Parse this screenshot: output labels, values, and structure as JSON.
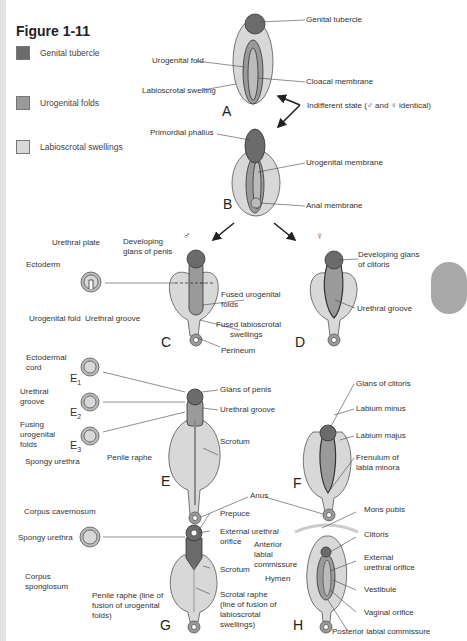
{
  "figure": {
    "title": "Figure 1-11",
    "colors": {
      "genital_tubercle": "#6b6b6b",
      "urogenital_folds": "#9a9a9a",
      "labioscrotal_swellings": "#d8d8d8",
      "strip": "#e3e3e3",
      "tab": "#a8a8a8"
    }
  },
  "legend": [
    {
      "label": "Genital tubercle",
      "color": "#6b6b6b"
    },
    {
      "label": "Urogenital folds",
      "color": "#9a9a9a"
    },
    {
      "label": "Labioscrotal swellings",
      "color": "#d8d8d8"
    }
  ],
  "panels": {
    "A": {
      "letter": "A",
      "labels": {
        "urogenital_fold": "Urogenital fold",
        "labioscrotal_swelling": "Labioscrotal swelling",
        "genital_tubercle": "Genital tubercle",
        "cloacal_membrane": "Cloacal membrane"
      }
    },
    "indifferent": "Indifferent state (♂ and ♀ identical)",
    "B": {
      "letter": "B",
      "labels": {
        "primordial_phallus": "Primordial phallus",
        "urogenital_membrane": "Urogenital membrane",
        "anal_membrane": "Anal membrane"
      }
    },
    "male_symbol": "♂",
    "female_symbol": "♀",
    "C": {
      "letter": "C",
      "labels": {
        "urethral_plate": "Urethral plate",
        "ectoderm": "Ectoderm",
        "urogenital_fold": "Urogenital fold",
        "urethral_groove": "Urethral groove",
        "developing_glans_1": "Developing",
        "developing_glans_2": "glans of penis",
        "fused_folds_1": "Fused urogenital",
        "fused_folds_2": "folds",
        "fused_swell_1": "Fused labioscrotal",
        "fused_swell_2": "swellings",
        "perineum": "Perineum"
      }
    },
    "D": {
      "letter": "D",
      "labels": {
        "glans_1": "Developing glans",
        "glans_2": "of clitoris",
        "urethral_groove": "Urethral groove"
      }
    },
    "E": {
      "letter": "E",
      "labels": {
        "ectodermal_1": "Ectodermal",
        "ectodermal_2": "cord",
        "e1": "E",
        "e1_sub": "1",
        "urethral_groove_1": "Urethral",
        "urethral_groove_2": "groove",
        "e2": "E",
        "e2_sub": "2",
        "fusing_1": "Fusing",
        "fusing_2": "urogenital",
        "fusing_3": "folds",
        "e3": "E",
        "e3_sub": "3",
        "spongy_urethra": "Spongy urethra",
        "penile_raphe": "Penile raphe",
        "glans_of_penis": "Glans of penis",
        "urethral_groove": "Urethral groove",
        "scrotum": "Scrotum",
        "anus": "Anus"
      }
    },
    "F": {
      "letter": "F",
      "labels": {
        "glans_of_clitoris": "Glans of clitoris",
        "labium_minus": "Labium minus",
        "labium_majus": "Labium majus",
        "frenulum_1": "Frenulum of",
        "frenulum_2": "labia minora"
      }
    },
    "G": {
      "letter": "G",
      "labels": {
        "corpus_cavernosum": "Corpus cavernosum",
        "spongy_urethra": "Spongy urethra",
        "corpus_sp_1": "Corpus",
        "corpus_sp_2": "spongiosum",
        "raphe_1": "Penile raphe (line of",
        "raphe_2": "fusion of urogenital",
        "raphe_3": "folds)",
        "prepuce": "Prepuce",
        "ext_1": "External urethral",
        "ext_2": "orifice",
        "scrotum": "Scrotum",
        "scrotal_1": "Scrotal raphe",
        "scrotal_2": "(line of fusion of",
        "scrotal_3": "labioscrotal",
        "scrotal_4": "swellings)"
      }
    },
    "H": {
      "letter": "H",
      "labels": {
        "mons_pubis": "Mons pubis",
        "clitoris": "Clitoris",
        "anterior_1": "Anterior",
        "anterior_2": "labial",
        "anterior_3": "commissure",
        "ext_1": "External",
        "ext_2": "urethral orifice",
        "hymen": "Hymen",
        "vestibule": "Vestibule",
        "vaginal_orifice": "Vaginal orifice",
        "posterior": "Posterior labial commissure"
      }
    }
  }
}
